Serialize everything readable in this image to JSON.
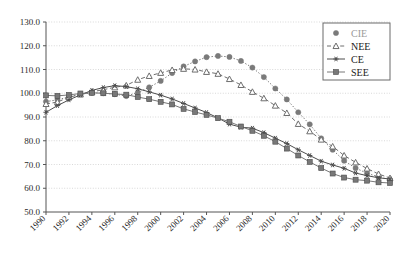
{
  "chart_data": {
    "type": "line",
    "title": "",
    "xlabel": "",
    "ylabel": "",
    "xlim": [
      1990,
      2020
    ],
    "ylim": [
      50.0,
      130.0
    ],
    "grid": true,
    "legend_position": "top-right",
    "ytick_labels": [
      "130.0",
      "120.0",
      "110.0",
      "100.0",
      "90.0",
      "80.0",
      "70.0",
      "60.0",
      "50.0"
    ],
    "ytick_values": [
      130,
      120,
      110,
      100,
      90,
      80,
      70,
      60,
      50
    ],
    "xtick_labels": [
      "1990",
      "1992",
      "1994",
      "1996",
      "1998",
      "2000",
      "2002",
      "2004",
      "2006",
      "2008",
      "2010",
      "2012",
      "2014",
      "2016",
      "2018",
      "2020"
    ],
    "xtick_values": [
      1990,
      1992,
      1994,
      1996,
      1998,
      2000,
      2002,
      2004,
      2006,
      2008,
      2010,
      2012,
      2014,
      2016,
      2018,
      2020
    ],
    "x": [
      1990,
      1991,
      1992,
      1993,
      1994,
      1995,
      1996,
      1997,
      1998,
      1999,
      2000,
      2001,
      2002,
      2003,
      2004,
      2005,
      2006,
      2007,
      2008,
      2009,
      2010,
      2011,
      2012,
      2013,
      2014,
      2015,
      2016,
      2017,
      2018,
      2019,
      2020
    ],
    "series": [
      {
        "name": "CIE",
        "marker": "circle-filled",
        "linestyle": "dotted",
        "color": "#7a7a7a",
        "values": [
          96.5,
          97.2,
          98.5,
          99.6,
          100.2,
          100.0,
          99.6,
          98.8,
          100.3,
          102.5,
          105.2,
          108.5,
          111.3,
          113.4,
          115.2,
          115.7,
          115.3,
          113.6,
          110.8,
          106.8,
          102.0,
          97.4,
          92.0,
          86.9,
          81.0,
          76.2,
          71.6,
          68.5,
          66.3,
          64.8,
          63.6
        ]
      },
      {
        "name": "NEE",
        "marker": "triangle-open",
        "linestyle": "dashed",
        "color": "#6e6e6e",
        "values": [
          95.5,
          96.3,
          98.3,
          99.5,
          100.6,
          101.5,
          102.5,
          103.3,
          105.7,
          107.3,
          108.6,
          109.8,
          110.3,
          110.0,
          109.0,
          108.2,
          106.0,
          103.5,
          100.6,
          97.9,
          94.8,
          91.7,
          87.1,
          84.0,
          80.5,
          77.6,
          73.8,
          70.9,
          68.3,
          66.0,
          64.3
        ]
      },
      {
        "name": "CE",
        "marker": "star",
        "linestyle": "solid",
        "color": "#4d4d4d",
        "values": [
          92.0,
          94.8,
          97.2,
          99.3,
          101.2,
          102.4,
          103.2,
          102.8,
          101.9,
          100.6,
          99.2,
          97.6,
          95.7,
          93.8,
          91.9,
          89.6,
          87.0,
          85.7,
          85.3,
          83.4,
          81.1,
          78.8,
          76.2,
          73.8,
          71.4,
          69.8,
          68.4,
          66.4,
          65.3,
          64.4,
          63.9
        ]
      },
      {
        "name": "SEE",
        "marker": "square-filled",
        "linestyle": "solid",
        "color": "#787878",
        "values": [
          99.1,
          98.9,
          99.3,
          99.9,
          100.2,
          100.0,
          99.7,
          99.4,
          98.4,
          97.5,
          96.4,
          95.3,
          93.4,
          92.1,
          90.9,
          89.5,
          88.0,
          86.0,
          84.2,
          82.1,
          79.6,
          76.7,
          73.8,
          71.1,
          68.5,
          66.2,
          64.5,
          63.6,
          63.2,
          62.5,
          62.2
        ]
      }
    ],
    "legend_entries": [
      {
        "label": "CIE",
        "marker": "circle-filled",
        "linestyle": "none",
        "faint": true
      },
      {
        "label": "NEE",
        "marker": "triangle-open",
        "linestyle": "dashed",
        "faint": false
      },
      {
        "label": "CE",
        "marker": "star",
        "linestyle": "solid",
        "faint": false
      },
      {
        "label": "SEE",
        "marker": "square-filled",
        "linestyle": "solid",
        "faint": false
      }
    ]
  },
  "colors": {
    "axis": "#555555",
    "grid": "#c8c8c8",
    "background": "#ffffff",
    "legend_border": "#6a6a6a"
  }
}
